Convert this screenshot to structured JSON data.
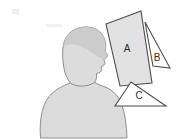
{
  "image": {
    "title": "Head silhouette with labeled geometric shapes",
    "width": 182,
    "height": 139,
    "background_color": "#ffffff"
  },
  "silhouette": {
    "name": "person-head-and-shoulders-silhouette",
    "description": "Grey filled profile of a human head, neck and shoulders facing right",
    "fill_color": "#d9d9d9",
    "hair_fill_color": "#c9c9c9",
    "outline_color": "#8a8a8a"
  },
  "shapes": [
    {
      "id": "shape-a",
      "label": "A",
      "type": "quadrilateral",
      "fill_color": "#e0e0e0",
      "stroke_color": "#4d4d4d",
      "label_x": 127,
      "label_y": 49,
      "points": "106,24 141,11 152,83 120,86"
    },
    {
      "id": "shape-b",
      "label": "B",
      "type": "triangle",
      "fill_color": "#ffffff",
      "stroke_color": "#4d4d4d",
      "label_x": 157,
      "label_y": 58,
      "points": "145,22 153,66 170,68"
    },
    {
      "id": "shape-c",
      "label": "C",
      "type": "triangle",
      "fill_color": "#ffffff",
      "stroke_color": "#4d4d4d",
      "label_x": 139,
      "label_y": 96,
      "points": "131,82 115,106 166,106"
    }
  ],
  "marks": {
    "corner_smudge": {
      "name": "faint-corner-mark",
      "color": "#e8e8e8"
    }
  }
}
